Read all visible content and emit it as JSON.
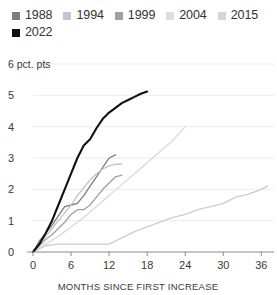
{
  "chart_data": {
    "type": "line",
    "title": "",
    "subtitle": "",
    "xlabel": "MONTHS SINCE FIRST INCREASE",
    "ylabel": "6 pct. pts",
    "y_unit": "pct. pts",
    "xlim": [
      0,
      38
    ],
    "ylim": [
      0,
      6
    ],
    "xticks": [
      0,
      6,
      12,
      18,
      24,
      30,
      36
    ],
    "xtick_labels": [
      "0",
      "6",
      "12",
      "18",
      "24",
      "30",
      "36"
    ],
    "yticks": [
      0,
      1,
      2,
      3,
      4,
      5,
      6
    ],
    "ytick_labels": [
      "0",
      "1",
      "2",
      "3",
      "4",
      "5",
      "6 pct. pts"
    ],
    "grid": "horizontal",
    "legend_position": "top-left",
    "series": [
      {
        "name": "1988",
        "color": "#7d7d7d",
        "x": [
          0,
          1,
          2,
          3,
          4,
          5,
          6,
          7,
          8,
          9,
          10,
          11,
          12,
          13
        ],
        "values": [
          0.0,
          0.35,
          0.6,
          0.85,
          1.15,
          1.45,
          1.5,
          1.55,
          1.8,
          2.1,
          2.4,
          2.7,
          3.0,
          3.1
        ]
      },
      {
        "name": "1994",
        "color": "#c4c4c4",
        "x": [
          0,
          1,
          2,
          3,
          4,
          5,
          6,
          7,
          8,
          9,
          10,
          11,
          12,
          13,
          14
        ],
        "values": [
          0.0,
          0.25,
          0.5,
          0.75,
          1.0,
          1.25,
          1.5,
          1.8,
          2.05,
          2.3,
          2.5,
          2.65,
          2.75,
          2.8,
          2.8
        ]
      },
      {
        "name": "1999",
        "color": "#a0a0a0",
        "x": [
          0,
          1,
          2,
          3,
          4,
          5,
          6,
          7,
          8,
          9,
          10,
          11,
          12,
          13,
          14
        ],
        "values": [
          0.0,
          0.2,
          0.4,
          0.55,
          0.75,
          0.95,
          1.2,
          1.35,
          1.35,
          1.5,
          1.75,
          2.0,
          2.2,
          2.4,
          2.45
        ]
      },
      {
        "name": "2004",
        "color": "#d9d9d9",
        "x": [
          0,
          2,
          4,
          6,
          8,
          10,
          12,
          14,
          16,
          18,
          20,
          22,
          24
        ],
        "values": [
          0.0,
          0.25,
          0.5,
          0.8,
          1.1,
          1.45,
          1.8,
          2.15,
          2.5,
          2.85,
          3.2,
          3.55,
          4.0
        ]
      },
      {
        "name": "2015",
        "color": "#cdcdcd",
        "x": [
          0,
          2,
          4,
          6,
          8,
          10,
          12,
          14,
          16,
          18,
          20,
          22,
          24,
          26,
          28,
          30,
          32,
          34,
          36,
          37
        ],
        "values": [
          0.0,
          0.2,
          0.25,
          0.25,
          0.25,
          0.25,
          0.25,
          0.45,
          0.65,
          0.8,
          0.95,
          1.1,
          1.2,
          1.35,
          1.45,
          1.55,
          1.75,
          1.85,
          2.0,
          2.1
        ]
      },
      {
        "name": "2022",
        "color": "#111111",
        "x": [
          0,
          1,
          2,
          3,
          4,
          5,
          6,
          7,
          8,
          9,
          10,
          11,
          12,
          13,
          14,
          15,
          16,
          17,
          18
        ],
        "values": [
          0.0,
          0.25,
          0.6,
          1.0,
          1.5,
          2.0,
          2.5,
          3.0,
          3.4,
          3.6,
          3.95,
          4.25,
          4.45,
          4.6,
          4.75,
          4.85,
          4.95,
          5.05,
          5.12
        ]
      }
    ]
  },
  "legend": {
    "items": [
      {
        "label": "1988",
        "color": "#7d7d7d"
      },
      {
        "label": "1994",
        "color": "#c4c4c4"
      },
      {
        "label": "1999",
        "color": "#a0a0a0"
      },
      {
        "label": "2004",
        "color": "#dedede"
      },
      {
        "label": "2015",
        "color": "#d4d4d4"
      },
      {
        "label": "2022",
        "color": "#111111"
      }
    ]
  },
  "axes": {
    "y_top_label": "6 pct. pts",
    "x_axis_title": "MONTHS SINCE FIRST INCREASE"
  }
}
